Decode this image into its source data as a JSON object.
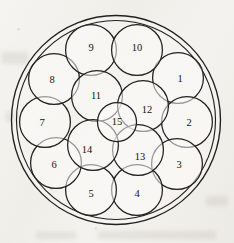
{
  "figure": {
    "canvas": {
      "width": 234,
      "height": 243
    },
    "background_color": "#f3f2ee",
    "line_color": "#20201e",
    "label_color": "#15140f",
    "boundary": {
      "name": "container-circle",
      "cx": 116,
      "cy": 120,
      "r": 104.5
    },
    "inner_guide": {
      "name": "inner-guide-circle",
      "cx": 116,
      "cy": 120,
      "r": 99.5
    },
    "packed_circle_radius": 25.4,
    "center_circle_radius": 19.5,
    "circles": [
      {
        "label": "1",
        "cx": 178,
        "cy": 78,
        "r": 25.4
      },
      {
        "label": "2",
        "cx": 187,
        "cy": 122,
        "r": 25.4
      },
      {
        "label": "3",
        "cx": 177,
        "cy": 164,
        "r": 25.4
      },
      {
        "label": "4",
        "cx": 137,
        "cy": 190,
        "r": 25.4
      },
      {
        "label": "5",
        "cx": 91,
        "cy": 190,
        "r": 25.4
      },
      {
        "label": "6",
        "cx": 56,
        "cy": 163,
        "r": 25.4
      },
      {
        "label": "7",
        "cx": 45,
        "cy": 122,
        "r": 25.4
      },
      {
        "label": "8",
        "cx": 54,
        "cy": 79,
        "r": 25.4
      },
      {
        "label": "9",
        "cx": 91,
        "cy": 50,
        "r": 25.4
      },
      {
        "label": "10",
        "cx": 137,
        "cy": 50,
        "r": 25.4
      },
      {
        "label": "11",
        "cx": 97,
        "cy": 96,
        "r": 25.4
      },
      {
        "label": "12",
        "cx": 143,
        "cy": 106,
        "r": 25.4
      },
      {
        "label": "13",
        "cx": 138,
        "cy": 150,
        "r": 25.4
      },
      {
        "label": "14",
        "cx": 93,
        "cy": 145,
        "r": 25.4
      },
      {
        "label": "15",
        "cx": 117,
        "cy": 122,
        "r": 19.5
      }
    ],
    "label_offsets": {
      "1": {
        "dx": 2,
        "dy": 0
      },
      "2": {
        "dx": 2,
        "dy": 0
      },
      "3": {
        "dx": 2,
        "dy": 0
      },
      "4": {
        "dx": 0,
        "dy": 3
      },
      "5": {
        "dx": 0,
        "dy": 3
      },
      "6": {
        "dx": -2,
        "dy": 1
      },
      "7": {
        "dx": -3,
        "dy": 0
      },
      "8": {
        "dx": -2,
        "dy": 0
      },
      "9": {
        "dx": 0,
        "dy": -3
      },
      "10": {
        "dx": 0,
        "dy": -3
      },
      "11": {
        "dx": -1,
        "dy": -1
      },
      "12": {
        "dx": 4,
        "dy": 3
      },
      "13": {
        "dx": 2,
        "dy": 6
      },
      "14": {
        "dx": -6,
        "dy": 4
      },
      "15": {
        "dx": 0,
        "dy": -1
      }
    }
  }
}
